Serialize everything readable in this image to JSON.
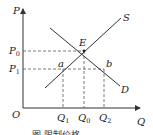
{
  "diagram": {
    "type": "supply-demand",
    "axes": {
      "x_label": "Q",
      "y_label": "P",
      "origin": "O"
    },
    "curves": [
      {
        "name": "S",
        "label": "S"
      },
      {
        "name": "D",
        "label": "D"
      }
    ],
    "points": {
      "equilibrium": "E",
      "a": "a",
      "b": "b"
    },
    "price_levels": [
      {
        "label": "P",
        "sub": "0"
      },
      {
        "label": "P",
        "sub": "1"
      }
    ],
    "quantity_levels": [
      {
        "label": "Q",
        "sub": "1"
      },
      {
        "label": "Q",
        "sub": "0"
      },
      {
        "label": "Q",
        "sub": "2"
      }
    ],
    "caption": "图 限制价格"
  }
}
